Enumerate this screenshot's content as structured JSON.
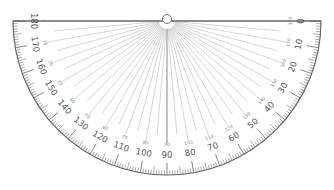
{
  "protractor": {
    "center": [
      167,
      21
    ],
    "radius": 154,
    "line_color": "#666666",
    "ray_color": "#bbbbbb",
    "outer_scale_labels": [
      "0",
      "10",
      "20",
      "30",
      "40",
      "50",
      "60",
      "70",
      "80",
      "90",
      "100",
      "110",
      "120",
      "130",
      "140",
      "150",
      "160",
      "170",
      "180"
    ],
    "inner_scale_labels": [
      "180",
      "170",
      "160",
      "150",
      "140",
      "130",
      "120",
      "110",
      "100",
      "90",
      "80",
      "70",
      "60",
      "50",
      "40",
      "30",
      "20",
      "10",
      "0"
    ],
    "outer_label_order_note": "left end shows 180, right end shows 0"
  }
}
